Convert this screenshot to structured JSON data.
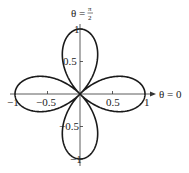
{
  "chart_data": {
    "type": "line",
    "subtype": "polar",
    "title": "",
    "equation": "r = cos 2θ",
    "annotations": {
      "top": "θ = π/2",
      "right": "θ = 0"
    },
    "x_ticks": [
      -1,
      -0.5,
      0.5,
      1
    ],
    "x_tick_labels": [
      "−1",
      "−0.5",
      "0.5",
      "1"
    ],
    "y_ticks": [
      1,
      0.5,
      -0.5,
      -1
    ],
    "y_tick_labels": [
      "1",
      "0.5",
      "−0.5",
      "−1"
    ],
    "xlim": [
      -1,
      1
    ],
    "ylim": [
      -1,
      1
    ],
    "grid": false,
    "series": [
      {
        "name": "four-leaved rose",
        "petals": 4,
        "petal_tips": [
          [
            1,
            0
          ],
          [
            0,
            1
          ],
          [
            -1,
            0
          ],
          [
            0,
            -1
          ]
        ]
      }
    ]
  },
  "labels": {
    "theta_top": "θ = ",
    "pi": "π",
    "two": "2",
    "theta_right": "θ = 0",
    "xm1": "−1",
    "xm05": "−0.5",
    "x05": "0.5",
    "x1": "1",
    "y1": "1",
    "y05": "0.5",
    "ym05": "−0.5",
    "ym1": "−1"
  },
  "colors": {
    "curve": "#1a1a1a",
    "axis": "#333333"
  }
}
